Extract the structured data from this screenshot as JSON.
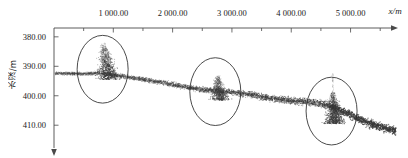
{
  "figure": {
    "type": "scatter-profile",
    "background": "#ffffff",
    "point_color": "#3a3a3a",
    "axis_color": "#4a4a4a",
    "circle_color": "#2b2b2b"
  },
  "axes": {
    "x": {
      "label": "x/m",
      "ticks": [
        1000,
        2000,
        3000,
        4000,
        5000
      ],
      "tick_labels": [
        "1 000.00",
        "2 000.00",
        "3 000.00",
        "4 000.00",
        "5 000.00"
      ],
      "minor_step": 500,
      "range": [
        0,
        5800
      ],
      "arrow": "right"
    },
    "y": {
      "label": "水深/m",
      "ticks": [
        380,
        390,
        400,
        410
      ],
      "tick_labels": [
        "380.00",
        "390.00",
        "400.00",
        "410.00"
      ],
      "range": [
        377,
        414
      ],
      "direction": "down",
      "arrow": "down"
    }
  },
  "chart_data": {
    "type": "scatter",
    "title": "",
    "xlabel": "x/m",
    "ylabel": "水深/m",
    "xlim": [
      0,
      5800
    ],
    "ylim": [
      377,
      414
    ],
    "grid": false,
    "legend": "none",
    "y_inverted": true,
    "series": [
      {
        "name": "seabed-profile",
        "description": "dense multibeam sounding point cloud, descending depth trend",
        "x": [
          250,
          500,
          750,
          1000,
          1250,
          1500,
          1750,
          2000,
          2250,
          2500,
          2750,
          3000,
          3250,
          3500,
          3750,
          4000,
          4250,
          4500,
          4750,
          5000,
          5250,
          5500,
          5750
        ],
        "y": [
          392.4,
          392.6,
          392.3,
          392.9,
          393.6,
          394.4,
          395.3,
          396.2,
          397.1,
          397.9,
          398.4,
          398.8,
          399.4,
          400.3,
          401.1,
          401.7,
          402.0,
          402.6,
          404.2,
          406.5,
          408.8,
          410.6,
          411.8
        ]
      }
    ],
    "annotations": [
      {
        "name": "anomaly-cluster-1",
        "shape": "circle",
        "center_x": 820,
        "center_y": 391.0,
        "radius_x": 430,
        "radius_y": 11.5,
        "note": "dense shallow spike cluster near 700-1000 m"
      },
      {
        "name": "anomaly-cluster-2",
        "shape": "circle",
        "center_x": 2720,
        "center_y": 398.6,
        "radius_x": 430,
        "radius_y": 11.5,
        "note": "vertical plume cluster near 2600-2900 m"
      },
      {
        "name": "anomaly-cluster-3",
        "shape": "circle",
        "center_x": 4680,
        "center_y": 405.2,
        "radius_x": 430,
        "radius_y": 11.5,
        "note": "large vertical plume cluster near 4500-4900 m"
      }
    ]
  }
}
